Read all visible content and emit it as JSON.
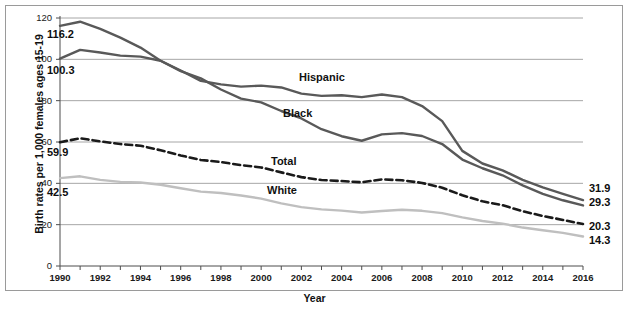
{
  "chart_data": {
    "type": "line",
    "title": "",
    "xlabel": "Year",
    "ylabel": "Birth rates per 1,000 females ages 15-19",
    "xlim": [
      1990,
      2016
    ],
    "ylim": [
      0,
      120
    ],
    "ytick_labels": [
      "0",
      "20",
      "40",
      "60",
      "80",
      "100",
      "120"
    ],
    "yticks": [
      0,
      20,
      40,
      60,
      80,
      100,
      120
    ],
    "xtick_labels": [
      "1990",
      "1992",
      "1994",
      "1996",
      "1998",
      "2000",
      "2002",
      "2004",
      "2006",
      "2008",
      "2010",
      "2012",
      "2014",
      "2016"
    ],
    "xticks": [
      1990,
      1992,
      1994,
      1996,
      1998,
      2000,
      2002,
      2004,
      2006,
      2008,
      2010,
      2012,
      2014,
      2016
    ],
    "x": [
      1990,
      1991,
      1992,
      1993,
      1994,
      1995,
      1996,
      1997,
      1998,
      1999,
      2000,
      2001,
      2002,
      2003,
      2004,
      2005,
      2006,
      2007,
      2008,
      2009,
      2010,
      2011,
      2012,
      2013,
      2014,
      2015,
      2016
    ],
    "grid": "horizontal",
    "legend_position": "inline-labels",
    "series": [
      {
        "name": "Black",
        "color": "#595959",
        "style": "solid",
        "start_label": "116.2",
        "end_label": "29.3",
        "values": [
          116.2,
          118.2,
          114.7,
          110.5,
          105.7,
          99.3,
          94.3,
          90.8,
          85.4,
          81.0,
          79.2,
          75.0,
          71.4,
          66.2,
          62.8,
          60.6,
          63.7,
          64.3,
          62.9,
          59.0,
          51.5,
          47.3,
          43.9,
          39.0,
          34.9,
          31.8,
          29.3
        ]
      },
      {
        "name": "Hispanic",
        "color": "#595959",
        "style": "solid",
        "start_label": "100.3",
        "end_label": "31.9",
        "values": [
          100.3,
          104.6,
          103.3,
          101.8,
          101.3,
          99.3,
          94.6,
          89.6,
          87.9,
          86.8,
          87.3,
          86.4,
          83.4,
          82.3,
          82.6,
          81.7,
          83.0,
          81.7,
          77.4,
          70.1,
          55.7,
          49.6,
          46.3,
          41.7,
          38.0,
          34.9,
          31.9
        ]
      },
      {
        "name": "Total",
        "color": "#1a1a1a",
        "style": "dashed",
        "start_label": "59.9",
        "end_label": "20.3",
        "values": [
          59.9,
          61.8,
          60.3,
          59.0,
          58.2,
          56.0,
          53.5,
          51.3,
          50.3,
          48.8,
          47.7,
          45.3,
          43.0,
          41.6,
          41.1,
          40.5,
          41.9,
          41.5,
          40.2,
          37.9,
          34.2,
          31.3,
          29.4,
          26.5,
          24.2,
          22.3,
          20.3
        ]
      },
      {
        "name": "White",
        "color": "#bfbfbf",
        "style": "solid",
        "start_label": "42.5",
        "end_label": "14.3",
        "values": [
          42.5,
          43.4,
          41.7,
          40.7,
          40.4,
          39.3,
          37.6,
          36.0,
          35.3,
          34.1,
          32.6,
          30.3,
          28.5,
          27.4,
          26.8,
          25.9,
          26.6,
          27.2,
          26.7,
          25.6,
          23.5,
          21.8,
          20.5,
          18.6,
          17.3,
          16.0,
          14.3
        ]
      }
    ]
  },
  "labels": {
    "hispanic": "Hispanic",
    "black": "Black",
    "total": "Total",
    "white": "White"
  },
  "value_labels": {
    "black_start": "116.2",
    "hispanic_start": "100.3",
    "total_start": "59.9",
    "white_start": "42.5",
    "hispanic_end": "31.9",
    "black_end": "29.3",
    "total_end": "20.3",
    "white_end": "14.3"
  },
  "axis": {
    "y_title": "Birth rates per 1,000 females ages 15-19",
    "x_title": "Year"
  },
  "colors": {
    "dark_line": "#595959",
    "light_line": "#bfbfbf",
    "dashed_line": "#1a1a1a",
    "grid": "#a6a6a6",
    "frame": "#9a9a9a"
  }
}
